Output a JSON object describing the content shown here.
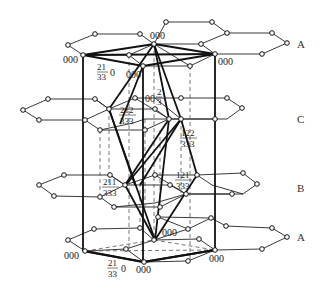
{
  "diagram": {
    "type": "crystal-structure-stacking",
    "layers": [
      {
        "id": "A_top",
        "label": "A"
      },
      {
        "id": "C",
        "label": "C"
      },
      {
        "id": "B",
        "label": "B"
      },
      {
        "id": "A_bottom",
        "label": "A"
      }
    ],
    "labels": {
      "top_back": "000",
      "top_left": "000",
      "top_right": "000",
      "top_front": "000",
      "top_frac": {
        "num": "21",
        "den": "33",
        "suffix": "0"
      },
      "c_frac1": {
        "prefix": "00",
        "num": "2",
        "den": "3"
      },
      "c_frac2": {
        "num": "212",
        "den": "333"
      },
      "c_frac3": {
        "num": "122",
        "den": "333"
      },
      "b_frac1": {
        "num": "211",
        "den": "333"
      },
      "b_frac2": {
        "num": "121",
        "den": "333"
      },
      "bot_back": "000",
      "bot_left": "000",
      "bot_right": "000",
      "bot_front": "000",
      "bot_frac": {
        "num": "21",
        "den": "33",
        "suffix": "0"
      }
    },
    "colors": {
      "line": "#111111",
      "dash": "#555555",
      "background": "#ffffff"
    }
  }
}
